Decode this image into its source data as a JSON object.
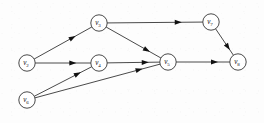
{
  "figure": {
    "type": "directed-graph",
    "background_color": "#fdfdfd",
    "stroke_color": "#1c1c1c",
    "node_fill": "#ffffff",
    "width": 264,
    "height": 123
  },
  "graph_data": {
    "type": "diagram",
    "directed": true,
    "node_radius": 8.2,
    "nodes": [
      {
        "id": "v2",
        "label": "v",
        "subscript": "2",
        "x": 27,
        "y": 63
      },
      {
        "id": "v3",
        "label": "v",
        "subscript": "3",
        "x": 99,
        "y": 23
      },
      {
        "id": "v4",
        "label": "v",
        "subscript": "4",
        "x": 99,
        "y": 63
      },
      {
        "id": "v5",
        "label": "v",
        "subscript": "5",
        "x": 168,
        "y": 62
      },
      {
        "id": "v6",
        "label": "v",
        "subscript": "6",
        "x": 27,
        "y": 100
      },
      {
        "id": "v7",
        "label": "v",
        "subscript": "7",
        "x": 211,
        "y": 22
      },
      {
        "id": "v8",
        "label": "v",
        "subscript": "8",
        "x": 238,
        "y": 62
      }
    ],
    "edges": [
      {
        "from": "v2",
        "to": "v3",
        "arrow_at": 0.72
      },
      {
        "from": "v2",
        "to": "v4",
        "arrow_at": 0.74
      },
      {
        "from": "v3",
        "to": "v7",
        "arrow_at": 0.78
      },
      {
        "from": "v3",
        "to": "v5",
        "arrow_at": 0.8
      },
      {
        "from": "v4",
        "to": "v5",
        "arrow_at": 0.79
      },
      {
        "from": "v6",
        "to": "v4",
        "arrow_at": 0.81
      },
      {
        "from": "v6",
        "to": "v5",
        "arrow_at": 0.86
      },
      {
        "from": "v7",
        "to": "v8",
        "arrow_at": 0.8
      },
      {
        "from": "v5",
        "to": "v8",
        "arrow_at": 0.78
      }
    ]
  }
}
